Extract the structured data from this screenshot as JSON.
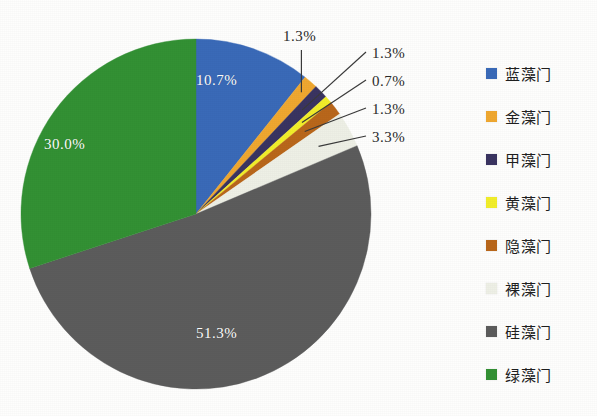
{
  "chart_data": {
    "type": "pie",
    "title": "",
    "subtitle": "",
    "xlabel": "",
    "ylabel": "",
    "legend_position": "right",
    "grid": false,
    "start_angle_deg": 0,
    "direction": "clockwise",
    "center": {
      "x": 196,
      "y": 214
    },
    "radius": 175,
    "categories": [
      "蓝藻门",
      "金藻门",
      "甲藻门",
      "黄藻门",
      "隐藻门",
      "裸藻门",
      "硅藻门",
      "绿藻门"
    ],
    "values": [
      10.7,
      1.3,
      1.3,
      0.7,
      1.3,
      3.3,
      51.3,
      30.0
    ],
    "labels": [
      "10.7%",
      "1.3%",
      "1.3%",
      "0.7%",
      "1.3%",
      "3.3%",
      "51.3%",
      "30.0%"
    ],
    "colors": [
      "#3a6ab8",
      "#f0a830",
      "#3a3461",
      "#f2ee2a",
      "#b9671b",
      "#eef0e6",
      "#5c5c5c",
      "#339134"
    ],
    "slices": [
      {
        "name": "蓝藻门",
        "value": 10.7,
        "label": "10.7%",
        "color": "#3a6ab8",
        "label_placement": "inside"
      },
      {
        "name": "金藻门",
        "value": 1.3,
        "label": "1.3%",
        "color": "#f0a830",
        "label_placement": "callout"
      },
      {
        "name": "甲藻门",
        "value": 1.3,
        "label": "1.3%",
        "color": "#3a3461",
        "label_placement": "callout"
      },
      {
        "name": "黄藻门",
        "value": 0.7,
        "label": "0.7%",
        "color": "#f2ee2a",
        "label_placement": "callout"
      },
      {
        "name": "隐藻门",
        "value": 1.3,
        "label": "1.3%",
        "color": "#b9671b",
        "label_placement": "callout"
      },
      {
        "name": "裸藻门",
        "value": 3.3,
        "label": "3.3%",
        "color": "#eef0e6",
        "label_placement": "callout"
      },
      {
        "name": "硅藻门",
        "value": 51.3,
        "label": "51.3%",
        "color": "#5c5c5c",
        "label_placement": "inside"
      },
      {
        "name": "绿藻门",
        "value": 30.0,
        "label": "30.0%",
        "color": "#339134",
        "label_placement": "inside"
      }
    ]
  },
  "inside_labels": {
    "blue": "10.7%",
    "green": "30.0%",
    "gray": "51.3%"
  },
  "callouts": {
    "jinzao": "1.3%",
    "jiazao": "1.3%",
    "huangzao": "0.7%",
    "yinzao": "1.3%",
    "luozao": "3.3%"
  },
  "legend": {
    "items": [
      {
        "label": "蓝藻门",
        "color": "#3a6ab8"
      },
      {
        "label": "金藻门",
        "color": "#f0a830"
      },
      {
        "label": "甲藻门",
        "color": "#3a3461"
      },
      {
        "label": "黄藻门",
        "color": "#f2ee2a"
      },
      {
        "label": "隐藻门",
        "color": "#b9671b"
      },
      {
        "label": "裸藻门",
        "color": "#eef0e6"
      },
      {
        "label": "硅藻门",
        "color": "#5c5c5c"
      },
      {
        "label": "绿藻门",
        "color": "#339134"
      }
    ]
  }
}
